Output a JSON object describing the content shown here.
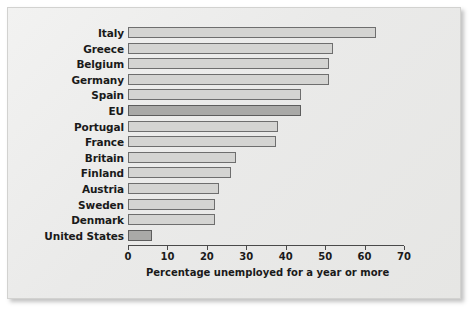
{
  "chart_data": {
    "type": "bar",
    "orientation": "horizontal",
    "title": "",
    "xlabel": "Percentage unemployed for a year or more",
    "ylabel": "",
    "xlim": [
      0,
      70
    ],
    "xticks": [
      0,
      10,
      20,
      30,
      40,
      50,
      60,
      70
    ],
    "xtick_labels": [
      "0",
      "10",
      "20",
      "30",
      "40",
      "50",
      "60",
      "70"
    ],
    "grid": false,
    "legend": null,
    "categories": [
      "Italy",
      "Greece",
      "Belgium",
      "Germany",
      "Spain",
      "EU",
      "Portugal",
      "France",
      "Britain",
      "Finland",
      "Austria",
      "Sweden",
      "Denmark",
      "United States"
    ],
    "values": [
      63,
      52,
      51,
      51,
      44,
      44,
      38,
      37.5,
      27.5,
      26,
      23,
      22,
      22,
      6
    ],
    "highlighted": [
      "EU",
      "United States"
    ],
    "colors": {
      "bar_fill": "#d4d4d2",
      "bar_fill_highlight": "#a9a9a7",
      "bar_stroke": "#6e6e6e",
      "axis": "#4a4a4a",
      "text": "#1a1a1a",
      "panel_background": "#ececeb",
      "page_background": "#ffffff"
    }
  },
  "axis": {
    "title": "Percentage unemployed for a year or more"
  }
}
